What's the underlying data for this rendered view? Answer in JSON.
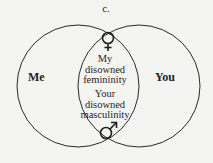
{
  "diagram": {
    "title": "c.",
    "left_circle_label": "Me",
    "right_circle_label": "You",
    "overlap": {
      "top_symbol": "female-symbol",
      "text_top": [
        "My",
        "disowned",
        "femininity"
      ],
      "text_bottom": [
        "Your",
        "disowned",
        "masculinity"
      ],
      "bottom_symbol": "male-symbol"
    },
    "colors": {
      "line": "#2a2a2a",
      "background": "#f4f4f2"
    }
  }
}
